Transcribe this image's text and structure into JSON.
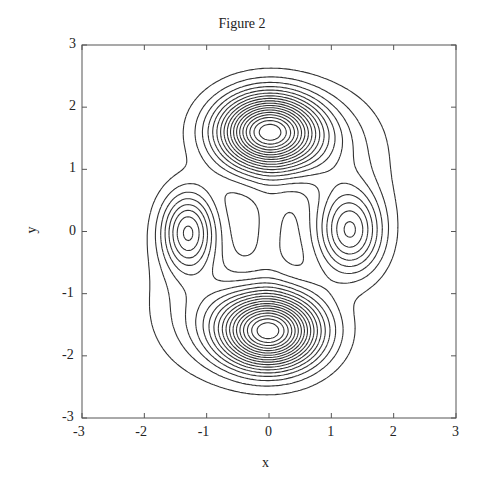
{
  "chart_data": {
    "type": "contour",
    "title": "Figure 2",
    "xlabel": "x",
    "ylabel": "y",
    "xlim": [
      -3,
      3
    ],
    "ylim": [
      -3,
      3
    ],
    "xticks": [
      -3,
      -2,
      -1,
      0,
      1,
      2,
      3
    ],
    "yticks": [
      -3,
      -2,
      -1,
      0,
      1,
      2,
      3
    ],
    "grid": false,
    "legend": null,
    "line_color": "#333333",
    "levels": 18,
    "peaks": [
      {
        "name": "top",
        "x": 0.0,
        "y": 1.6,
        "amp": 1.0,
        "sx": 0.78,
        "sy": 0.58
      },
      {
        "name": "bottom",
        "x": 0.0,
        "y": -1.6,
        "amp": 1.0,
        "sx": 0.78,
        "sy": 0.58
      },
      {
        "name": "left",
        "x": -1.3,
        "y": 0.0,
        "amp": 0.42,
        "sx": 0.42,
        "sy": 0.62
      },
      {
        "name": "right",
        "x": 1.3,
        "y": 0.0,
        "amp": 0.42,
        "sx": 0.5,
        "sy": 0.66
      },
      {
        "name": "top-right-shoulder",
        "x": 1.1,
        "y": 1.2,
        "amp": 0.12,
        "sx": 0.8,
        "sy": 0.9
      },
      {
        "name": "bottom-left-shoulder",
        "x": -1.1,
        "y": -1.2,
        "amp": 0.12,
        "sx": 0.8,
        "sy": 0.9
      },
      {
        "name": "center-ridge",
        "x": 0.0,
        "y": 0.0,
        "amp": 0.05,
        "sx": 0.3,
        "sy": 0.9
      }
    ],
    "level_min": 0.045,
    "level_max": 0.97
  },
  "figure": {
    "title": "Figure 2",
    "xlabel": "x",
    "ylabel": "y",
    "xtick_labels": [
      "-3",
      "-2",
      "-1",
      "0",
      "1",
      "2",
      "3"
    ],
    "ytick_labels": [
      "3",
      "2",
      "1",
      "0",
      "-1",
      "-2",
      "-3"
    ]
  }
}
